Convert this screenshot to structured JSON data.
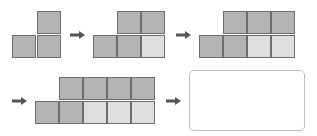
{
  "colors": {
    "dark_cell": "#b3b3b3",
    "light_cell": "#dedede",
    "border": "#6e6e6e",
    "arrow": "#555555"
  },
  "figures": [
    {
      "step": 1,
      "top_row": [
        "dark"
      ],
      "bottom_row": [
        "dark",
        "dark"
      ]
    },
    {
      "step": 2,
      "top_row": [
        "dark",
        "dark"
      ],
      "bottom_row": [
        "dark",
        "dark",
        "light"
      ]
    },
    {
      "step": 3,
      "top_row": [
        "dark",
        "dark",
        "dark"
      ],
      "bottom_row": [
        "dark",
        "dark",
        "light",
        "light"
      ]
    },
    {
      "step": 4,
      "top_row": [
        "dark",
        "dark",
        "dark",
        "dark"
      ],
      "bottom_row": [
        "dark",
        "dark",
        "light",
        "light",
        "light"
      ]
    }
  ],
  "arrows": [
    "right-arrow",
    "right-arrow",
    "right-arrow",
    "right-arrow"
  ],
  "answer_box": {
    "content": ""
  }
}
